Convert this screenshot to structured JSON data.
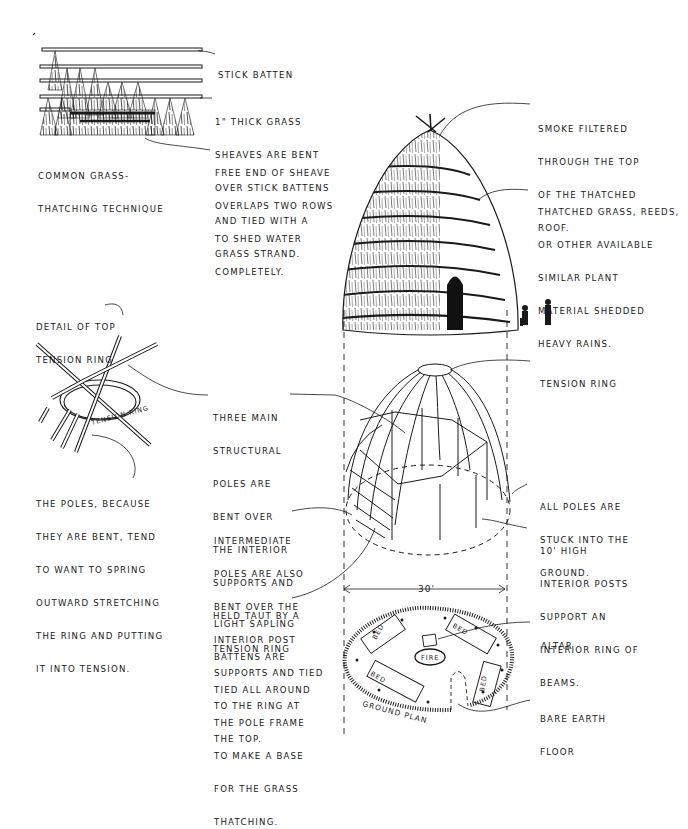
{
  "figure": {
    "thatching_detail": {
      "caption": [
        "COMMON GRASS-",
        "THATCHING TECHNIQUE"
      ],
      "labels": {
        "stick_batten": [
          "STICK BATTEN"
        ],
        "sheaves": [
          "1\" THICK GRASS",
          "SHEAVES ARE BENT",
          "OVER STICK BATTENS",
          "AND TIED WITH A",
          "GRASS STRAND."
        ],
        "free_end": [
          "FREE END OF SHEAVE",
          "OVERLAPS TWO ROWS",
          "TO SHED WATER",
          "COMPLETELY."
        ]
      }
    },
    "thatched_house": {
      "smoke": [
        "SMOKE FILTERED",
        "THROUGH THE TOP",
        "OF THE THATCHED",
        "ROOF."
      ],
      "thatch": [
        "THATCHED GRASS, REEDS,",
        "OR OTHER AVAILABLE",
        "SIMILAR PLANT",
        "MATERIAL SHEDDED",
        "HEAVY RAINS."
      ]
    },
    "tension_ring_detail": {
      "title": [
        "DETAIL OF TOP",
        "TENSION RING"
      ],
      "ring_label": "TENSION RING",
      "poles_note": [
        "THE POLES, BECAUSE",
        "THEY ARE BENT, TEND",
        "TO WANT TO SPRING",
        "OUTWARD STRETCHING",
        "THE RING AND PUTTING",
        "IT INTO TENSION."
      ]
    },
    "frame": {
      "three_main": [
        "THREE MAIN",
        "STRUCTURAL",
        "POLES ARE",
        "BENT OVER",
        "THE INTERIOR",
        "SUPPORTS AND",
        "HELD TAUT BY A",
        "TENSION RING"
      ],
      "tension_ring": [
        "TENSION RING"
      ],
      "all_poles": [
        "ALL POLES ARE",
        "STUCK INTO THE",
        "GROUND."
      ],
      "interior_posts": [
        "10' HIGH",
        "INTERIOR POSTS",
        "SUPPORT AN",
        "INTERIOR RING OF",
        "BEAMS."
      ],
      "intermediate": [
        "INTERMEDIATE",
        "POLES ARE ALSO",
        "BENT OVER THE",
        "INTERIOR POST",
        "SUPPORTS AND TIED",
        "TO THE RING AT",
        "THE TOP."
      ],
      "battens": [
        "LIGHT SAPLING",
        "BATTENS ARE",
        "TIED ALL AROUND",
        "THE POLE FRAME",
        "TO MAKE A BASE",
        "FOR THE GRASS",
        "THATCHING."
      ]
    },
    "ground_plan": {
      "dimension": "30'",
      "caption": "GROUND PLAN",
      "altar": [
        "ALTAR"
      ],
      "floor": [
        "BARE EARTH",
        "FLOOR"
      ],
      "fire": "FIRE",
      "bed": "BED"
    }
  }
}
